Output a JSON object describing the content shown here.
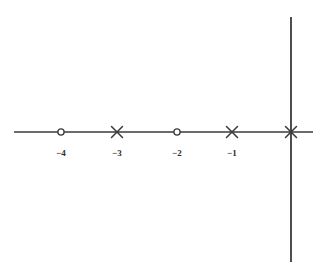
{
  "figure": {
    "width": 328,
    "height": 279,
    "background_color": "#ffffff",
    "stroke_color": "#3a3a3a",
    "label_color": "#2e2e2e"
  },
  "chart_data": {
    "type": "scatter",
    "title": "",
    "subtitle": "",
    "xlabel": "",
    "ylabel": "",
    "grid": false,
    "legend": null,
    "axes": {
      "horizontal_axis": {
        "name": "real-axis",
        "y_pixel": 132,
        "x_start_pixel": 14,
        "x_end_pixel": 313,
        "visible": true
      },
      "vertical_axis": {
        "name": "imaginary-axis",
        "x_pixel": 291,
        "y_start_pixel": 17,
        "y_end_pixel": 262,
        "visible": true
      }
    },
    "x": [
      -4,
      -3,
      -2,
      -1,
      0
    ],
    "y": [
      0,
      0,
      0,
      0,
      0
    ],
    "markers": [
      {
        "label": "-4",
        "tick_text": "−4",
        "x": -4,
        "y": 0,
        "marker": "circle",
        "x_pixel": 61,
        "y_pixel": 132,
        "has_tick_label": true
      },
      {
        "label": "-3",
        "tick_text": "−3",
        "x": -3,
        "y": 0,
        "marker": "cross",
        "x_pixel": 117,
        "y_pixel": 132,
        "has_tick_label": true
      },
      {
        "label": "-2",
        "tick_text": "−2",
        "x": -2,
        "y": 0,
        "marker": "circle",
        "x_pixel": 177,
        "y_pixel": 132,
        "has_tick_label": true
      },
      {
        "label": "-1",
        "tick_text": "−1",
        "x": -1,
        "y": 0,
        "marker": "cross",
        "x_pixel": 232,
        "y_pixel": 132,
        "has_tick_label": true
      },
      {
        "label": "0",
        "tick_text": "",
        "x": 0,
        "y": 0,
        "marker": "cross",
        "x_pixel": 291,
        "y_pixel": 132,
        "has_tick_label": false
      }
    ],
    "tick_labels": [
      {
        "text": "−4",
        "x_pixel": 61,
        "y_pixel": 153
      },
      {
        "text": "−3",
        "x_pixel": 117,
        "y_pixel": 153
      },
      {
        "text": "−2",
        "x_pixel": 177,
        "y_pixel": 153
      },
      {
        "text": "−1",
        "x_pixel": 232,
        "y_pixel": 153
      }
    ],
    "xlim": [
      -4.9,
      0.4
    ],
    "ylim": [
      -2.1,
      2.0
    ]
  }
}
